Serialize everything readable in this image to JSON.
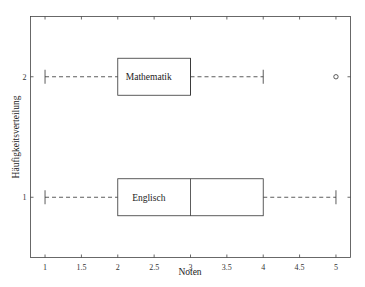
{
  "chart_data": {
    "type": "boxplot",
    "orientation": "horizontal",
    "title": "",
    "xlabel": "Noten",
    "ylabel": "Häufigkeitsverteilung",
    "xlim": [
      0.8,
      5.2
    ],
    "ylim": [
      0.5,
      2.5
    ],
    "xticks": [
      1,
      1.5,
      2,
      2.5,
      3,
      3.5,
      4,
      4.5,
      5
    ],
    "xtick_labels": [
      "1",
      "1.5",
      "2",
      "2.5",
      "3",
      "3.5",
      "4",
      "4.5",
      "5"
    ],
    "yticks": [
      1,
      2
    ],
    "ytick_labels": [
      "1",
      "2"
    ],
    "grid": false,
    "series": [
      {
        "name": "Englisch",
        "position": 1,
        "whisker_low": 1,
        "q1": 2,
        "median": 3,
        "q3": 4,
        "whisker_high": 5,
        "outliers": []
      },
      {
        "name": "Mathematik",
        "position": 2,
        "whisker_low": 1,
        "q1": 2,
        "median": 3,
        "q3": 3,
        "whisker_high": 4,
        "outliers": [
          5
        ]
      }
    ]
  }
}
